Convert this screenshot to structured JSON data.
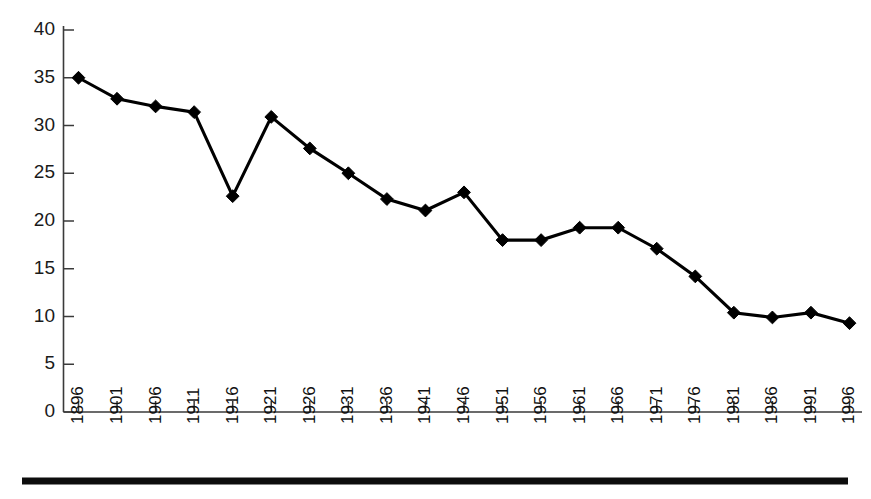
{
  "chart_data": {
    "type": "line",
    "title": "",
    "subtitle": "",
    "xlabel": "",
    "ylabel": "",
    "categories": [
      "1896",
      "1901",
      "1906",
      "1911",
      "1916",
      "1921",
      "1926",
      "1931",
      "1936",
      "1941",
      "1946",
      "1951",
      "1956",
      "1961",
      "1966",
      "1971",
      "1976",
      "1981",
      "1986",
      "1991",
      "1996"
    ],
    "values": [
      35.0,
      32.8,
      32.0,
      31.4,
      22.6,
      30.9,
      27.6,
      25.0,
      22.3,
      21.1,
      23.0,
      18.0,
      18.0,
      19.3,
      19.3,
      17.1,
      14.2,
      10.4,
      9.9,
      10.4,
      9.3
    ],
    "series": [
      {
        "name": "series-1",
        "values": [
          35.0,
          32.8,
          32.0,
          31.4,
          22.6,
          30.9,
          27.6,
          25.0,
          22.3,
          21.1,
          23.0,
          18.0,
          18.0,
          19.3,
          19.3,
          17.1,
          14.2,
          10.4,
          9.9,
          10.4,
          9.3
        ]
      }
    ],
    "ylim": [
      0,
      40
    ],
    "yticks": [
      0,
      5,
      10,
      15,
      20,
      25,
      30,
      35,
      40
    ],
    "ytick_labels": [
      "0",
      "5",
      "10",
      "15",
      "20",
      "25",
      "30",
      "35",
      "40"
    ],
    "grid": false,
    "legend": null,
    "legend_position": "none",
    "marker": "diamond",
    "line_color": "#000000",
    "marker_color": "#000000",
    "axis_color": "#3a3a3a",
    "background_color": "#ffffff",
    "xtick_label_rotation": -90,
    "annotations": []
  },
  "figure": {
    "bottom_rule_color": "#0d0d0d"
  }
}
